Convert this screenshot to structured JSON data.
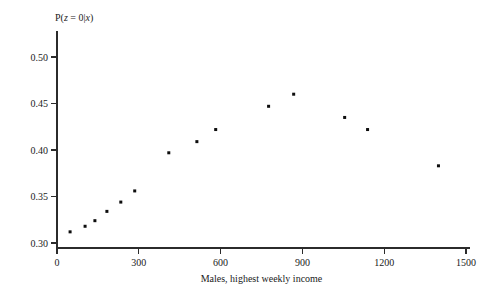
{
  "chart_data": {
    "type": "scatter",
    "title": "",
    "subtitle": "",
    "xlabel": "Males, highest weekly income",
    "ylabel": "P(z = 0|x)",
    "ylabel_parts": {
      "p": "P(",
      "z": "z",
      "eq": " = 0|",
      "x": "x",
      "close": ")"
    },
    "xlim": [
      0,
      1560
    ],
    "ylim": [
      0.295,
      0.515
    ],
    "xticks": [
      0,
      300,
      600,
      900,
      1200,
      1500
    ],
    "xtick_labels": [
      "0",
      "300",
      "600",
      "900",
      "1200",
      "1500"
    ],
    "yticks": [
      0.3,
      0.35,
      0.4,
      0.45,
      0.5
    ],
    "ytick_labels": [
      "0.30",
      "0.35",
      "0.40",
      "0.45",
      "0.50"
    ],
    "grid": false,
    "legend": null,
    "marker": {
      "shape": "square",
      "size_px": 3,
      "color": "#0d0d0d"
    },
    "points": [
      {
        "x": 48,
        "y": 0.312
      },
      {
        "x": 103,
        "y": 0.318
      },
      {
        "x": 139,
        "y": 0.324
      },
      {
        "x": 183,
        "y": 0.334
      },
      {
        "x": 234,
        "y": 0.344
      },
      {
        "x": 285,
        "y": 0.356
      },
      {
        "x": 410,
        "y": 0.397
      },
      {
        "x": 513,
        "y": 0.409
      },
      {
        "x": 582,
        "y": 0.422
      },
      {
        "x": 776,
        "y": 0.447
      },
      {
        "x": 868,
        "y": 0.46
      },
      {
        "x": 1055,
        "y": 0.435
      },
      {
        "x": 1139,
        "y": 0.422
      },
      {
        "x": 1399,
        "y": 0.383
      }
    ]
  },
  "figure": {
    "background_color": "#ffffff",
    "axis_color": "#2b2b2b"
  }
}
